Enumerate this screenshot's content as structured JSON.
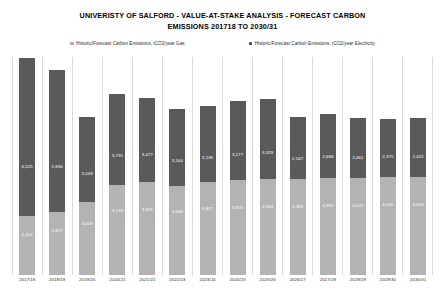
{
  "title": {
    "line1": "UNIVERISTY OF SALFORD - VALUE-AT-STAKE ANALYSIS - FORECAST CARBON",
    "line2": "EMISSIONS 201718 TO 2030/31"
  },
  "legend": [
    {
      "label": "Historic/Forecast Carbon Emissions, tCO2/year Gas",
      "color": "#b3b3b3",
      "key": "gas"
    },
    {
      "label": "Historic/Forecast Carbon Emissions, tCO2/year Electricity",
      "color": "#5a5a5a",
      "key": "electricity"
    }
  ],
  "chart_data": {
    "type": "bar",
    "subtype": "stacked-column",
    "title": "UNIVERISTY OF SALFORD - VALUE-AT-STAKE ANALYSIS - FORECAST CARBON EMISSIONS 201718 TO 2030/31",
    "xlabel": "",
    "ylabel": "",
    "ylim": [
      0,
      9000
    ],
    "grid": "vertical-only",
    "legend_position": "top",
    "axis_labels_visible": false,
    "categories": [
      "2017/18",
      "2018/19",
      "2019/20",
      "2020/21",
      "2021/22",
      "2022/23",
      "2023/24",
      "2024/25",
      "2025/26",
      "2026/27",
      "2027/28",
      "2028/29",
      "2029/30",
      "2030/31"
    ],
    "series": [
      {
        "name": "Historic/Forecast Carbon Emissions, tCO2/year Gas",
        "color": "#b3b3b3",
        "stack_position": "bottom",
        "values": [
          2424,
          2617,
          3018,
          3719,
          3821,
          3686,
          3827,
          3905,
          3944,
          3963,
          3992,
          4025,
          4060,
          4050
        ],
        "labels": [
          "2,424",
          "2,617",
          "3,018",
          "3,719",
          "3,821",
          "3,686",
          "3,827",
          "3,905",
          "3,944",
          "3,963",
          "3,992",
          "4,025",
          "4,060",
          "4,050"
        ]
      },
      {
        "name": "Historic/Forecast Carbon Emissions, tCO2/year Electricity",
        "color": "#5a5a5a",
        "stack_position": "top",
        "values": [
          6525,
          5836,
          3509,
          3735,
          3477,
          3164,
          3139,
          3277,
          3329,
          2547,
          2668,
          2461,
          2375,
          2422
        ],
        "labels": [
          "6,525",
          "5,836",
          "3,509",
          "3,735",
          "3,477",
          "3,164",
          "3,139",
          "3,277",
          "3,329",
          "2,547",
          "2,668",
          "2,461",
          "2,375",
          "2,422"
        ]
      }
    ],
    "totals": [
      8949,
      8453,
      6527,
      7454,
      7298,
      6850,
      6966,
      7182,
      7273,
      6510,
      6660,
      6486,
      6435,
      6472
    ]
  }
}
